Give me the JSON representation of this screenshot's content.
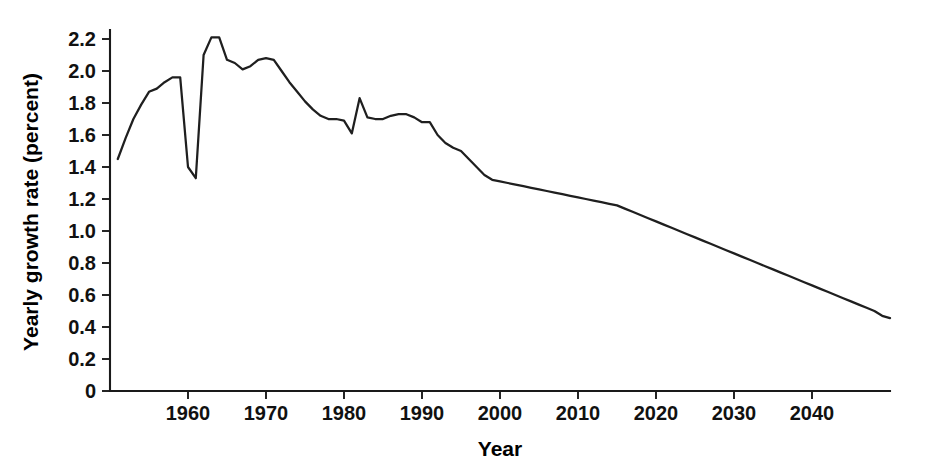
{
  "chart_data": {
    "type": "line",
    "title": "",
    "xlabel": "Year",
    "ylabel": "Yearly growth rate (percent)",
    "xlim": [
      1950,
      2050
    ],
    "ylim": [
      0,
      2.3
    ],
    "grid": false,
    "legend": null,
    "line_color": "#1f1f1f",
    "x_ticks": [
      1960,
      1970,
      1980,
      1990,
      2000,
      2010,
      2020,
      2030,
      2040
    ],
    "x_tick_labels": [
      "1960",
      "1970",
      "1980",
      "1990",
      "2000",
      "2010",
      "2020",
      "2030",
      "2040"
    ],
    "y_ticks": [
      0,
      0.2,
      0.4,
      0.6,
      0.8,
      1.0,
      1.2,
      1.4,
      1.6,
      1.8,
      2.0,
      2.2
    ],
    "y_tick_labels": [
      "0",
      "0.2",
      "0.4",
      "0.6",
      "0.8",
      "1.0",
      "1.2",
      "1.4",
      "1.6",
      "1.8",
      "2.0",
      "2.2"
    ],
    "series": [
      {
        "name": "World population yearly growth rate",
        "x": [
          1951,
          1952,
          1953,
          1954,
          1955,
          1956,
          1957,
          1958,
          1959,
          1960,
          1961,
          1962,
          1963,
          1964,
          1965,
          1966,
          1967,
          1968,
          1969,
          1970,
          1971,
          1972,
          1973,
          1974,
          1975,
          1976,
          1977,
          1978,
          1979,
          1980,
          1981,
          1982,
          1983,
          1984,
          1985,
          1986,
          1987,
          1988,
          1989,
          1990,
          1991,
          1992,
          1993,
          1994,
          1995,
          1996,
          1997,
          1998,
          1999,
          2000,
          2001,
          2002,
          2003,
          2004,
          2005,
          2006,
          2007,
          2008,
          2009,
          2010,
          2011,
          2012,
          2013,
          2014,
          2015,
          2016,
          2017,
          2018,
          2019,
          2020,
          2021,
          2022,
          2023,
          2024,
          2025,
          2026,
          2027,
          2028,
          2029,
          2030,
          2031,
          2032,
          2033,
          2034,
          2035,
          2036,
          2037,
          2038,
          2039,
          2040,
          2041,
          2042,
          2043,
          2044,
          2045,
          2046,
          2047,
          2048,
          2049,
          2050
        ],
        "y": [
          1.45,
          1.58,
          1.7,
          1.79,
          1.87,
          1.89,
          1.93,
          1.96,
          1.96,
          1.4,
          1.33,
          2.1,
          2.21,
          2.21,
          2.07,
          2.05,
          2.01,
          2.03,
          2.07,
          2.08,
          2.07,
          2.0,
          1.93,
          1.87,
          1.81,
          1.76,
          1.72,
          1.7,
          1.7,
          1.69,
          1.61,
          1.83,
          1.71,
          1.7,
          1.7,
          1.72,
          1.73,
          1.73,
          1.71,
          1.68,
          1.68,
          1.6,
          1.55,
          1.52,
          1.5,
          1.45,
          1.4,
          1.35,
          1.32,
          1.31,
          1.3,
          1.29,
          1.28,
          1.27,
          1.26,
          1.25,
          1.24,
          1.23,
          1.22,
          1.21,
          1.2,
          1.19,
          1.18,
          1.17,
          1.16,
          1.14,
          1.12,
          1.1,
          1.08,
          1.06,
          1.04,
          1.02,
          1.0,
          0.98,
          0.96,
          0.94,
          0.92,
          0.9,
          0.88,
          0.86,
          0.84,
          0.82,
          0.8,
          0.78,
          0.76,
          0.74,
          0.72,
          0.7,
          0.68,
          0.66,
          0.64,
          0.62,
          0.6,
          0.58,
          0.56,
          0.54,
          0.52,
          0.5,
          0.47,
          0.455
        ]
      }
    ]
  }
}
